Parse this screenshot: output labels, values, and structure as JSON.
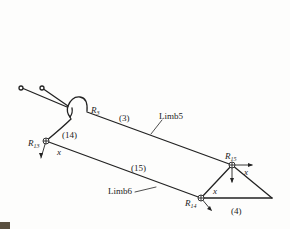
{
  "diagram": {
    "type": "mechanism-kinematic-sketch",
    "limbs": [
      {
        "id": "limb5",
        "label": "Limb5",
        "link": "(3)"
      },
      {
        "id": "limb6",
        "label": "Limb6",
        "link": "(15)"
      }
    ],
    "links": [
      {
        "id": "link14",
        "label": "(14)"
      },
      {
        "id": "link3",
        "label": "(3)"
      },
      {
        "id": "link15",
        "label": "(15)"
      },
      {
        "id": "link4",
        "label": "(4)"
      }
    ],
    "joints": [
      {
        "id": "R3",
        "base": "R",
        "sub": "3"
      },
      {
        "id": "R13",
        "base": "R",
        "sub": "13"
      },
      {
        "id": "R14",
        "base": "R",
        "sub": "14"
      },
      {
        "id": "R15",
        "base": "R",
        "sub": "15"
      }
    ],
    "axis_label": "x",
    "colors": {
      "line": "#222222",
      "background": "#fdfdfc"
    }
  },
  "labels": {
    "limb5": "Limb5",
    "limb6": "Limb6",
    "link3": "(3)",
    "link14": "(14)",
    "link15": "(15)",
    "link4": "(4)",
    "r3_base": "R",
    "r3_sub": "3",
    "r13_base": "R",
    "r13_sub": "13",
    "r14_base": "R",
    "r14_sub": "14",
    "r15_base": "R",
    "r15_sub": "15",
    "x_r13": "x",
    "x_r14": "x",
    "x_r15": "x"
  }
}
